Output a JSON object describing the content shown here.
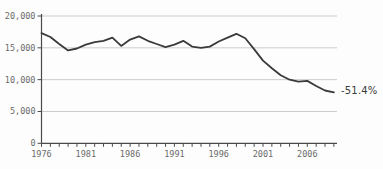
{
  "chart_data": {
    "type": "line",
    "title": "",
    "xlabel": "",
    "ylabel": "",
    "x": [
      1976,
      1977,
      1978,
      1979,
      1980,
      1981,
      1982,
      1983,
      1984,
      1985,
      1986,
      1987,
      1988,
      1989,
      1990,
      1991,
      1992,
      1993,
      1994,
      1995,
      1996,
      1997,
      1998,
      1999,
      2000,
      2001,
      2002,
      2003,
      2004,
      2005,
      2006,
      2007,
      2008,
      2009
    ],
    "series": [
      {
        "name": "value",
        "values": [
          17300,
          16700,
          15600,
          14600,
          14900,
          15500,
          15900,
          16100,
          16600,
          15300,
          16300,
          16800,
          16100,
          15600,
          15100,
          15500,
          16100,
          15200,
          15000,
          15200,
          16000,
          16600,
          17200,
          16500,
          14800,
          13000,
          11800,
          10700,
          10000,
          9700,
          9800,
          9000,
          8300,
          8000
        ]
      }
    ],
    "ylim": [
      0,
      20000
    ],
    "yticks": [
      0,
      5000,
      10000,
      15000,
      20000
    ],
    "ytick_labels": [
      "0",
      "5,000",
      "10,000",
      "15,000",
      "20,000"
    ],
    "xtick_years_minor_interval": 1,
    "xtick_label_years": [
      1976,
      1981,
      1986,
      1991,
      1996,
      2001,
      2006
    ],
    "grid": "horizontal",
    "legend": "none",
    "annotation": {
      "text": "-51.4%",
      "position": "line-end"
    },
    "colors": {
      "line": "#3a3a3a",
      "grid": "#cccccc",
      "axis": "#4a4a4a",
      "tick": "#4a4a4a",
      "tick_label": "#6a6a6a",
      "annotation": "#3b3b3b"
    }
  }
}
